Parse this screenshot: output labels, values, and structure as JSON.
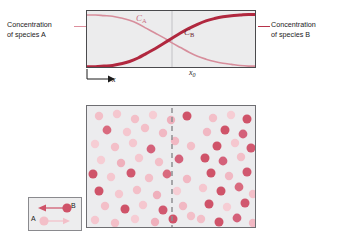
{
  "figure": {
    "background_color": "#ffffff"
  },
  "chart_data": {
    "type": "line",
    "title": "",
    "xlabel": "x",
    "ylabel": "",
    "grid": false,
    "legend_position": "inline-curve-labels",
    "annotations": [
      {
        "name": "x0",
        "text": "x0",
        "x": 0.5,
        "note": "vertical reference line at interface"
      }
    ],
    "x": [
      0,
      0.05,
      0.1,
      0.15,
      0.2,
      0.25,
      0.3,
      0.35,
      0.4,
      0.45,
      0.5,
      0.55,
      0.6,
      0.65,
      0.7,
      0.75,
      0.8,
      0.85,
      0.9,
      0.95,
      1.0
    ],
    "series": [
      {
        "name": "C_A",
        "label": "CA",
        "color": "#d78e9c",
        "width": 1.6,
        "values": [
          0.93,
          0.93,
          0.92,
          0.91,
          0.88,
          0.84,
          0.78,
          0.7,
          0.62,
          0.54,
          0.45,
          0.37,
          0.29,
          0.22,
          0.17,
          0.13,
          0.1,
          0.08,
          0.06,
          0.05,
          0.05
        ]
      },
      {
        "name": "C_B",
        "label": "CB",
        "color": "#b1283f",
        "width": 3.0,
        "values": [
          0.04,
          0.04,
          0.05,
          0.06,
          0.09,
          0.13,
          0.19,
          0.27,
          0.35,
          0.44,
          0.53,
          0.62,
          0.7,
          0.77,
          0.83,
          0.87,
          0.9,
          0.92,
          0.93,
          0.94,
          0.94
        ]
      }
    ],
    "xlim": [
      0,
      1
    ],
    "ylim": [
      0,
      1
    ]
  },
  "chart": {
    "left_label_line1": "Concentration",
    "left_label_line2": "of species A",
    "right_label_line1": "Concentration",
    "right_label_line2": "of species B",
    "curve_a_label": "C",
    "curve_a_sub": "A",
    "curve_b_label": "C",
    "curve_b_sub": "B",
    "x_axis_label": "x",
    "x0_label": "x",
    "x0_sub": "0",
    "panel_fill": "#ececed",
    "panel_border": "#4a4a4d",
    "color_a": "#d78e9c",
    "color_b": "#b1283f"
  },
  "particles": {
    "panel_fill": "#ececee",
    "panel_border": "#6e6e72",
    "divider_style": "dashed",
    "divider_color": "#8e8e92",
    "color_a": "#f2bcc6",
    "color_a_dark": "#e79dab",
    "color_b": "#cc5a6e",
    "color_b_dark": "#c0485f",
    "left_region_label": "species A rich",
    "right_region_label": "species B rich",
    "dots": [
      {
        "x": 12,
        "y": 10,
        "r": 4.2,
        "c": "#f3bfc8"
      },
      {
        "x": 30,
        "y": 8,
        "r": 4.2,
        "c": "#f5c7cf"
      },
      {
        "x": 48,
        "y": 13,
        "r": 4.2,
        "c": "#f3bfc8"
      },
      {
        "x": 66,
        "y": 9,
        "r": 4.2,
        "c": "#f6cdd4"
      },
      {
        "x": 84,
        "y": 14,
        "r": 4.2,
        "c": "#efb0bc"
      },
      {
        "x": 20,
        "y": 24,
        "r": 4.4,
        "c": "#d96a7e"
      },
      {
        "x": 40,
        "y": 26,
        "r": 4.2,
        "c": "#f5c7cf"
      },
      {
        "x": 58,
        "y": 22,
        "r": 4.2,
        "c": "#f3bfc8"
      },
      {
        "x": 76,
        "y": 27,
        "r": 4.2,
        "c": "#f1b8c3"
      },
      {
        "x": 100,
        "y": 10,
        "r": 4.5,
        "c": "#cf5369"
      },
      {
        "x": 8,
        "y": 38,
        "r": 4.2,
        "c": "#f6cdd4"
      },
      {
        "x": 28,
        "y": 41,
        "r": 4.2,
        "c": "#f3bfc8"
      },
      {
        "x": 46,
        "y": 37,
        "r": 4.2,
        "c": "#f5c7cf"
      },
      {
        "x": 64,
        "y": 43,
        "r": 4.4,
        "c": "#d4617a"
      },
      {
        "x": 88,
        "y": 35,
        "r": 4.2,
        "c": "#f1b8c3"
      },
      {
        "x": 104,
        "y": 40,
        "r": 4.2,
        "c": "#f3bfc8"
      },
      {
        "x": 14,
        "y": 54,
        "r": 4.2,
        "c": "#f6cdd4"
      },
      {
        "x": 34,
        "y": 57,
        "r": 4.2,
        "c": "#efb0bc"
      },
      {
        "x": 52,
        "y": 52,
        "r": 4.2,
        "c": "#f5c7cf"
      },
      {
        "x": 72,
        "y": 56,
        "r": 4.2,
        "c": "#f3bfc8"
      },
      {
        "x": 92,
        "y": 53,
        "r": 4.4,
        "c": "#d4617a"
      },
      {
        "x": 6,
        "y": 68,
        "r": 4.5,
        "c": "#cf5369"
      },
      {
        "x": 24,
        "y": 71,
        "r": 4.2,
        "c": "#f5c7cf"
      },
      {
        "x": 44,
        "y": 67,
        "r": 4.5,
        "c": "#d1586f"
      },
      {
        "x": 62,
        "y": 72,
        "r": 4.2,
        "c": "#f3bfc8"
      },
      {
        "x": 80,
        "y": 68,
        "r": 4.4,
        "c": "#d96a7e"
      },
      {
        "x": 100,
        "y": 73,
        "r": 4.2,
        "c": "#f1b8c3"
      },
      {
        "x": 12,
        "y": 85,
        "r": 4.5,
        "c": "#cf5369"
      },
      {
        "x": 32,
        "y": 88,
        "r": 4.2,
        "c": "#f5c7cf"
      },
      {
        "x": 50,
        "y": 84,
        "r": 4.2,
        "c": "#f3bfc8"
      },
      {
        "x": 70,
        "y": 89,
        "r": 4.2,
        "c": "#efb0bc"
      },
      {
        "x": 90,
        "y": 85,
        "r": 4.2,
        "c": "#f6cdd4"
      },
      {
        "x": 18,
        "y": 100,
        "r": 4.2,
        "c": "#f3bfc8"
      },
      {
        "x": 38,
        "y": 103,
        "r": 4.5,
        "c": "#cf5369"
      },
      {
        "x": 56,
        "y": 99,
        "r": 4.2,
        "c": "#f5c7cf"
      },
      {
        "x": 76,
        "y": 104,
        "r": 4.5,
        "c": "#d1586f"
      },
      {
        "x": 96,
        "y": 100,
        "r": 4.2,
        "c": "#f1b8c3"
      },
      {
        "x": 8,
        "y": 114,
        "r": 4.2,
        "c": "#f5c7cf"
      },
      {
        "x": 28,
        "y": 117,
        "r": 4.2,
        "c": "#f3bfc8"
      },
      {
        "x": 48,
        "y": 113,
        "r": 4.2,
        "c": "#f6cdd4"
      },
      {
        "x": 68,
        "y": 116,
        "r": 4.2,
        "c": "#efb0bc"
      },
      {
        "x": 86,
        "y": 113,
        "r": 4.5,
        "c": "#cf5369"
      },
      {
        "x": 104,
        "y": 110,
        "r": 4.2,
        "c": "#f3bfc8"
      },
      {
        "x": 126,
        "y": 12,
        "r": 4.2,
        "c": "#f3bfc8"
      },
      {
        "x": 144,
        "y": 9,
        "r": 4.2,
        "c": "#f6cdd4"
      },
      {
        "x": 160,
        "y": 13,
        "r": 4.5,
        "c": "#cf5369"
      },
      {
        "x": 120,
        "y": 26,
        "r": 4.2,
        "c": "#f1b8c3"
      },
      {
        "x": 138,
        "y": 24,
        "r": 4.5,
        "c": "#cf5369"
      },
      {
        "x": 156,
        "y": 28,
        "r": 4.4,
        "c": "#d4617a"
      },
      {
        "x": 130,
        "y": 40,
        "r": 4.5,
        "c": "#cf5369"
      },
      {
        "x": 148,
        "y": 37,
        "r": 4.2,
        "c": "#f5c7cf"
      },
      {
        "x": 164,
        "y": 42,
        "r": 4.5,
        "c": "#d1586f"
      },
      {
        "x": 118,
        "y": 52,
        "r": 4.5,
        "c": "#cf5369"
      },
      {
        "x": 136,
        "y": 55,
        "r": 4.4,
        "c": "#d4617a"
      },
      {
        "x": 154,
        "y": 51,
        "r": 4.2,
        "c": "#f3bfc8"
      },
      {
        "x": 124,
        "y": 67,
        "r": 4.5,
        "c": "#cf5369"
      },
      {
        "x": 142,
        "y": 70,
        "r": 4.2,
        "c": "#f1b8c3"
      },
      {
        "x": 160,
        "y": 66,
        "r": 4.5,
        "c": "#d1586f"
      },
      {
        "x": 116,
        "y": 82,
        "r": 4.2,
        "c": "#f5c7cf"
      },
      {
        "x": 134,
        "y": 85,
        "r": 4.5,
        "c": "#cf5369"
      },
      {
        "x": 152,
        "y": 81,
        "r": 4.4,
        "c": "#d96a7e"
      },
      {
        "x": 166,
        "y": 88,
        "r": 4.2,
        "c": "#f3bfc8"
      },
      {
        "x": 122,
        "y": 98,
        "r": 4.5,
        "c": "#cf5369"
      },
      {
        "x": 140,
        "y": 101,
        "r": 4.2,
        "c": "#f6cdd4"
      },
      {
        "x": 158,
        "y": 97,
        "r": 4.5,
        "c": "#d1586f"
      },
      {
        "x": 114,
        "y": 113,
        "r": 4.2,
        "c": "#f3bfc8"
      },
      {
        "x": 132,
        "y": 116,
        "r": 4.5,
        "c": "#cf5369"
      },
      {
        "x": 150,
        "y": 112,
        "r": 4.4,
        "c": "#d4617a"
      },
      {
        "x": 166,
        "y": 117,
        "r": 4.2,
        "c": "#f1b8c3"
      }
    ]
  },
  "legend": {
    "species_b_letter": "B",
    "species_a_letter": "A",
    "species_b_color": "#cf5369",
    "species_a_color": "#f3bfc8",
    "arrow_b_direction": "left",
    "arrow_a_direction": "right",
    "panel_fill": "#ededee",
    "panel_border": "#8a8a8e"
  }
}
